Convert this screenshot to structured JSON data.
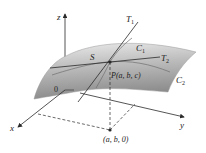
{
  "diagram": {
    "title": "",
    "labels": {
      "z_axis": "z",
      "x_axis": "x",
      "y_axis": "y",
      "origin": "0",
      "surface": "S",
      "tangent1": "T",
      "tangent1_sub": "1",
      "tangent2": "T",
      "tangent2_sub": "2",
      "curve1": "C",
      "curve1_sub": "1",
      "curve2": "C",
      "curve2_sub": "2",
      "point_p": "P(a, b, c)",
      "point_base": "(a, b, 0)"
    },
    "colors": {
      "surface_light": "#e6e6e6",
      "surface_dark": "#8f8f8f",
      "line": "#2a2a2a",
      "background": "#ffffff"
    }
  }
}
